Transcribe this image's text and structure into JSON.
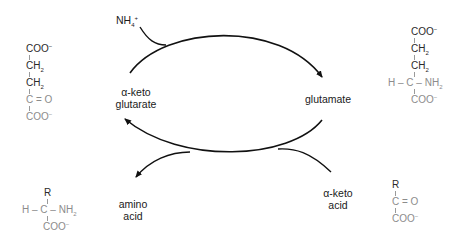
{
  "diagram": {
    "type": "transamination cycle",
    "labels": {
      "ammonium": "NH",
      "ammonium_sub": "4",
      "ammonium_sup": "+",
      "alpha_ketoglutarate_line1": "α-keto",
      "alpha_ketoglutarate_line2": "glutarate",
      "glutamate": "glutamate",
      "amino_acid_line1": "amino",
      "amino_acid_line2": "acid",
      "alpha_keto_acid_line1": "α-keto",
      "alpha_keto_acid_line2": "acid"
    },
    "structures": {
      "alpha_ketoglutarate": {
        "coo_top": "COO",
        "ch2_a": "CH",
        "ch2_b": "CH",
        "carbonyl": "C = O",
        "coo_bottom": "COO",
        "sub2": "2",
        "minus": "−"
      },
      "glutamate": {
        "coo_top": "COO",
        "ch2_a": "CH",
        "ch2_b": "CH",
        "h": "H",
        "c": "C",
        "nh2": "NH",
        "coo_bottom": "COO",
        "sub2": "2",
        "minus": "−"
      },
      "amino_acid": {
        "r": "R",
        "h": "H",
        "c": "C",
        "nh2": "NH",
        "coo": "COO",
        "sub2": "2",
        "minus": "−"
      },
      "alpha_keto_acid": {
        "r": "R",
        "carbonyl": "C = O",
        "coo": "COO",
        "minus": "−"
      }
    },
    "colors": {
      "arrow": "#111111",
      "label_text": "#1a1a1a",
      "structure_gray": "#8c8c8c",
      "structure_dark": "#2a2a2a"
    }
  }
}
